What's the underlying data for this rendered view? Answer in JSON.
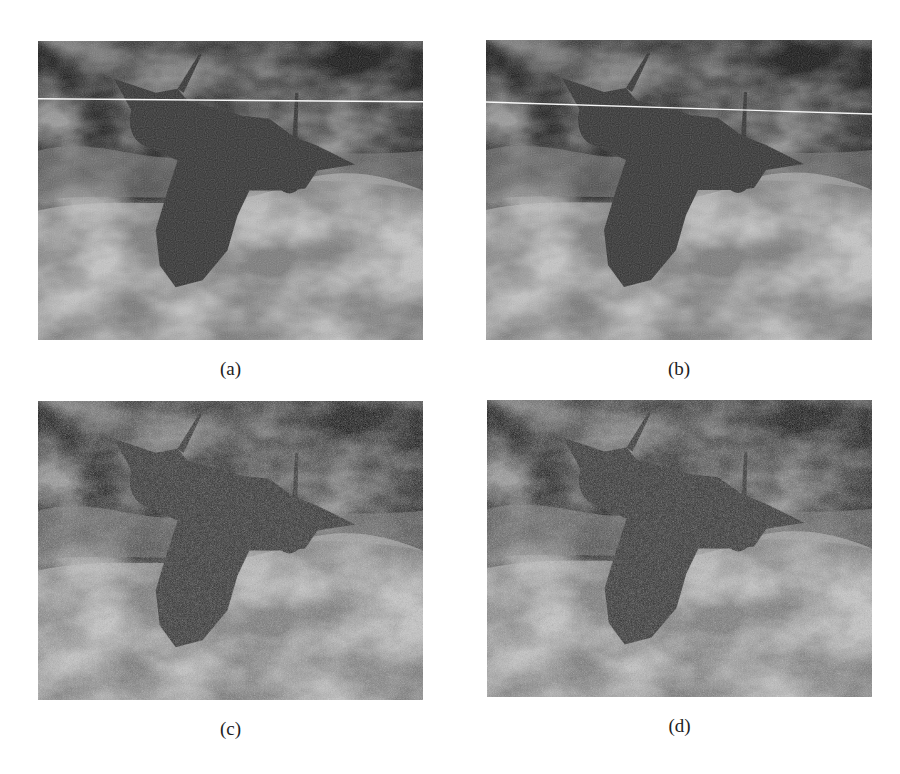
{
  "figure": {
    "panels": [
      {
        "id": "a",
        "caption": "(a)",
        "box": {
          "x": 38,
          "y": 41,
          "w": 385,
          "h": 299
        },
        "scanline": {
          "y1": 58,
          "y2": 61
        },
        "noise_style": "smooth",
        "base_frequency": 0.9
      },
      {
        "id": "b",
        "caption": "(b)",
        "box": {
          "x": 486,
          "y": 40,
          "w": 386,
          "h": 300
        },
        "scanline": {
          "y1": 62,
          "y2": 74
        },
        "noise_style": "smooth",
        "base_frequency": 0.9
      },
      {
        "id": "c",
        "caption": "(c)",
        "box": {
          "x": 38,
          "y": 401,
          "w": 385,
          "h": 299
        },
        "scanline": null,
        "noise_style": "speckled",
        "base_frequency": 1.4
      },
      {
        "id": "d",
        "caption": "(d)",
        "box": {
          "x": 487,
          "y": 400,
          "w": 385,
          "h": 297
        },
        "scanline": null,
        "noise_style": "speckled",
        "base_frequency": 1.4
      }
    ],
    "colors": {
      "sky_light": "#c9c9c9",
      "sky_dark": "#7a7a7a",
      "aircraft": "#2e2e2e",
      "scanline": "#ffffff",
      "caption_text": "#222222"
    }
  }
}
